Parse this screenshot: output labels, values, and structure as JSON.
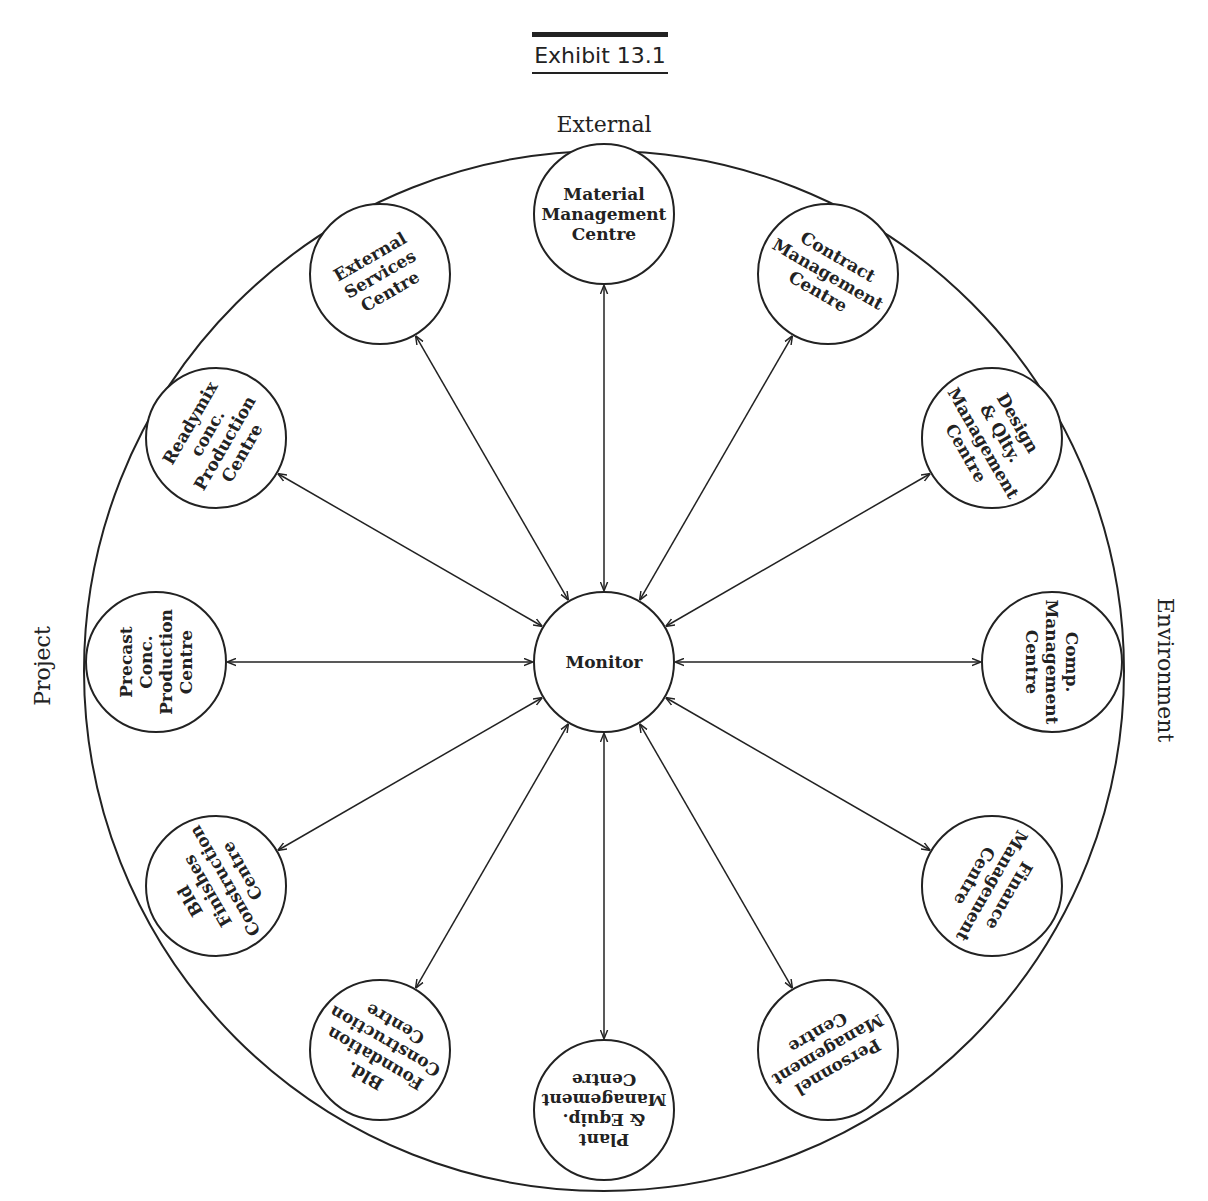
{
  "exhibit": {
    "label": "Exhibit 13.1"
  },
  "edge_labels": {
    "top": "External",
    "left": "Project",
    "right": "Environment"
  },
  "center": {
    "label": "Monitor"
  },
  "nodes": [
    {
      "id": "material",
      "angle": 0,
      "lines": [
        "Material",
        "Management",
        "Centre"
      ]
    },
    {
      "id": "contract",
      "angle": 30,
      "lines": [
        "Contract",
        "Management",
        "Centre"
      ]
    },
    {
      "id": "design",
      "angle": 60,
      "lines": [
        "Design",
        "& Qlty.",
        "Management",
        "Centre"
      ]
    },
    {
      "id": "comp",
      "angle": 90,
      "lines": [
        "Comp.",
        "Management",
        "Centre"
      ]
    },
    {
      "id": "finance",
      "angle": 120,
      "lines": [
        "Finance",
        "Management",
        "Centre"
      ]
    },
    {
      "id": "personnel",
      "angle": 150,
      "lines": [
        "Personnel",
        "Management",
        "Centre"
      ]
    },
    {
      "id": "plant",
      "angle": 180,
      "lines": [
        "Plant",
        "& Equip.",
        "Management",
        "Centre"
      ]
    },
    {
      "id": "foundation",
      "angle": 210,
      "lines": [
        "Bld.",
        "Foundation",
        "Construction",
        "Centre"
      ]
    },
    {
      "id": "finishes",
      "angle": 240,
      "lines": [
        "Bld",
        "Finishes",
        "Construction",
        "Centre"
      ]
    },
    {
      "id": "precast",
      "angle": 270,
      "lines": [
        "Precast",
        "Conc.",
        "Production",
        "Centre"
      ]
    },
    {
      "id": "readymix",
      "angle": 300,
      "lines": [
        "Readymix",
        "conc.",
        "Production",
        "Centre"
      ]
    },
    {
      "id": "external",
      "angle": 330,
      "lines": [
        "External",
        "Services",
        "Centre"
      ]
    }
  ],
  "colors": {
    "ink": "#222222",
    "paper": "#ffffff"
  }
}
